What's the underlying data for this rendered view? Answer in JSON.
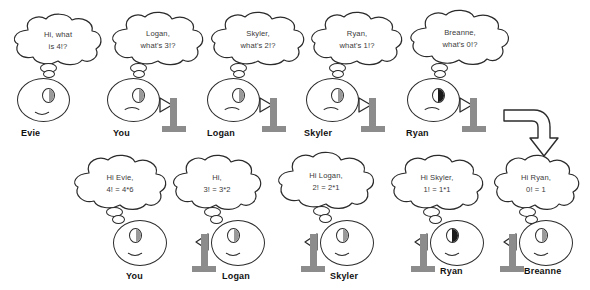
{
  "diagram": {
    "colors": {
      "stand_gray": "#8c8c8c",
      "outline": "#2b2b2b",
      "text_gray": "#3a3a3a",
      "label_black": "#111111",
      "background": "#ffffff"
    },
    "top_row": {
      "row_label": "question-pass-down",
      "figures": [
        {
          "name_label": "Evie",
          "bubble_line1": "Hi, what",
          "bubble_line2": "is 4!?",
          "has_stand": false,
          "eye_dark": false,
          "expression": "smile"
        },
        {
          "name_label": "You",
          "bubble_line1": "Logan,",
          "bubble_line2": "what's 3!?",
          "has_stand": true,
          "eye_dark": false,
          "expression": "frown"
        },
        {
          "name_label": "Logan",
          "bubble_line1": "Skyler,",
          "bubble_line2": "what's 2!?",
          "has_stand": true,
          "eye_dark": false,
          "expression": "frown"
        },
        {
          "name_label": "Skyler",
          "bubble_line1": "Ryan,",
          "bubble_line2": "what's 1!?",
          "has_stand": true,
          "eye_dark": false,
          "expression": "frown"
        },
        {
          "name_label": "Ryan",
          "bubble_line1": "Breanne,",
          "bubble_line2": "what's 0!?",
          "has_stand": true,
          "eye_dark": true,
          "expression": "frown"
        }
      ]
    },
    "bottom_row": {
      "row_label": "answer-pass-back",
      "figures": [
        {
          "name_label": "You",
          "bubble_line1": "Hi Evie,",
          "bubble_line2": "4! = 4*6",
          "has_stand": false,
          "eye_dark": false,
          "expression": "smile"
        },
        {
          "name_label": "Logan",
          "bubble_line1": "Hi,",
          "bubble_line2": "3! = 3*2",
          "has_stand": true,
          "eye_dark": false,
          "expression": "smile"
        },
        {
          "name_label": "Skyler",
          "bubble_line1": "Hi Logan,",
          "bubble_line2": "2! = 2*1",
          "has_stand": true,
          "eye_dark": false,
          "expression": "smile"
        },
        {
          "name_label": "Ryan",
          "bubble_line1": "Hi Skyler,",
          "bubble_line2": "1! = 1*1",
          "has_stand": true,
          "eye_dark": true,
          "expression": "smile"
        },
        {
          "name_label": "Breanne",
          "bubble_line1": "Hi Ryan,",
          "bubble_line2": "0! = 1",
          "has_stand": true,
          "eye_dark": false,
          "expression": "smile"
        }
      ]
    },
    "flow_arrow": {
      "icon": "curved-down-arrow-icon",
      "direction": "right-then-down"
    }
  }
}
